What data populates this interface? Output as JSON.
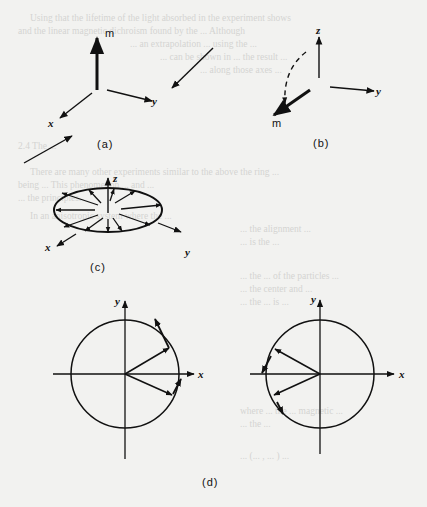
{
  "figure": {
    "panels": [
      {
        "id": "a",
        "caption": "(a)",
        "labels": {
          "m": "m",
          "x": "x",
          "y": "y"
        }
      },
      {
        "id": "b",
        "caption": "(b)",
        "labels": {
          "z": "z",
          "y": "y",
          "m": "m"
        }
      },
      {
        "id": "c",
        "caption": "(c)",
        "labels": {
          "z": "z",
          "x": "x",
          "y": "y"
        }
      },
      {
        "id": "d",
        "caption": "(d)",
        "left": {
          "x": "x",
          "y": "y"
        },
        "right": {
          "x": "x",
          "y": "y"
        }
      }
    ]
  },
  "show_through_text": [
    "Using that the lifetime of the light absorbed in the experiment shows",
    "and the linear magnetic dichroism found by the ... Although",
    "... an extrapolation ... using the ...",
    "... can be shown in ... the result ...",
    "... along those axes ...",
    "2.4 The ...",
    "There are many other experiments similar to the above the ring ...",
    "being ... This phenomenon ... and ...",
    "... the principles.",
    "In an anisotropic system where the ...",
    "... the alignment ...",
    "... is the ...",
    "... the ... of the particles ...",
    "... the center and ...",
    "... the ... is ...",
    "where ... the ... magnetic ...",
    "... the ... ",
    "... (... , ... ) ..."
  ]
}
